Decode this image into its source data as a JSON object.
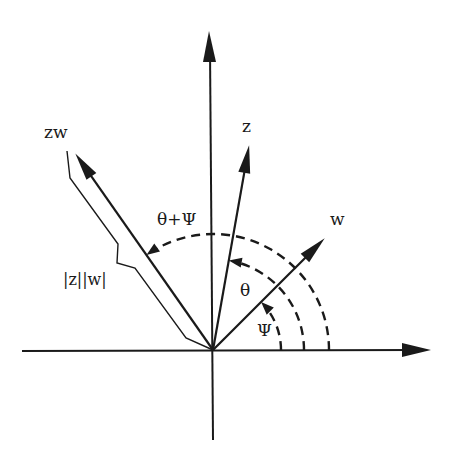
{
  "diagram": {
    "labels": {
      "product": "zw",
      "z": "z",
      "w": "w",
      "sum_angle": "θ+Ψ",
      "theta": "θ",
      "psi": "Ψ",
      "modulus": "|z||w|"
    },
    "vectors": [
      {
        "name": "w",
        "angle_deg": 45
      },
      {
        "name": "z",
        "angle_deg": 80
      },
      {
        "name": "zw",
        "angle_deg": 125
      }
    ],
    "arcs": [
      {
        "name": "psi",
        "from_deg": 0,
        "to_deg": 45
      },
      {
        "name": "theta",
        "from_deg": 0,
        "to_deg": 80
      },
      {
        "name": "theta_plus_psi",
        "from_deg": 0,
        "to_deg": 125
      }
    ],
    "colors": {
      "ink": "#1a1a1a",
      "background": "#ffffff"
    }
  }
}
